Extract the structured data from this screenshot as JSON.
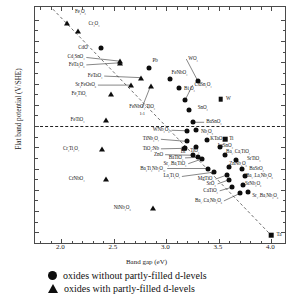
{
  "chart_data": {
    "type": "scatter",
    "title": "",
    "xlabel": "Band gap (eV)",
    "ylabel": "Flat band potential (V/SHE)",
    "xlim": [
      1.75,
      4.15
    ],
    "ylim": [
      -1.12,
      1.12
    ],
    "xticks": [
      2.0,
      2.5,
      3.0,
      3.5,
      4.0
    ],
    "yticks": [
      1.0,
      0.8,
      0.6,
      0.4,
      0.2,
      0,
      -0.2,
      -0.4,
      -0.6,
      -0.8,
      -1.0
    ],
    "grid": false,
    "zero_line": true,
    "trend_line": "dashed guide from upper-left to lower-right",
    "legend_position": "below-axes",
    "legend": [
      {
        "marker": "circle",
        "label": "oxides without partly-filled d-levels"
      },
      {
        "marker": "triangle",
        "label": "oxides with partly-filled d-levels"
      }
    ],
    "series": [
      {
        "name": "oxides with partly-filled d-levels",
        "marker": "triangle",
        "points": [
          {
            "label": "Fe₂O₃",
            "x": 2.05,
            "y": 0.97,
            "lx": 2.13,
            "ly": 1.07,
            "anchor": "left"
          },
          {
            "label": "Cr₂O₃",
            "x": 2.16,
            "y": 0.89,
            "lx": 2.26,
            "ly": 0.96,
            "anchor": "left"
          },
          {
            "label": "Cd₂SnO₄",
            "x": 2.56,
            "y": 0.61,
            "lx": 2.22,
            "ly": 0.645,
            "anchor": "right",
            "lead": true
          },
          {
            "label": "FeTa₂O₆",
            "x": 2.56,
            "y": 0.595,
            "lx": 2.22,
            "ly": 0.575,
            "anchor": "right",
            "lead": true
          },
          {
            "label": "FeTaO₄",
            "x": 2.76,
            "y": 0.455,
            "lx": 2.39,
            "ly": 0.47,
            "anchor": "right",
            "lead": true
          },
          {
            "label": "Sr₂FeOsO₆",
            "x": 2.66,
            "y": 0.385,
            "lx": 2.33,
            "ly": 0.385,
            "anchor": "right",
            "lead": true
          },
          {
            "label": "Fe₂TiO₅",
            "x": 2.47,
            "y": 0.3,
            "lx": 2.24,
            "ly": 0.3,
            "anchor": "right"
          },
          {
            "label": "FeNbO₄:TiO₃",
            "x": 2.85,
            "y": 0.375,
            "lx": 2.77,
            "ly": 0.175,
            "anchor": "center",
            "lead": true,
            "sub": "1:1"
          },
          {
            "label": "FeTiO₃",
            "x": 2.43,
            "y": 0.055,
            "lx": 2.22,
            "ly": 0.055,
            "anchor": "right"
          },
          {
            "label": "Cr₂Ti₂O₇",
            "x": 2.39,
            "y": -0.215,
            "lx": 2.17,
            "ly": -0.215,
            "anchor": "right"
          },
          {
            "label": "CrNbO₄",
            "x": 2.43,
            "y": -0.495,
            "lx": 2.22,
            "ly": -0.495,
            "anchor": "right"
          },
          {
            "label": "NiNb₂O₆",
            "x": 2.87,
            "y": -0.775,
            "lx": 2.66,
            "ly": -0.775,
            "anchor": "right"
          }
        ]
      },
      {
        "name": "oxides without partly-filled d-levels",
        "marker": "circle",
        "points": [
          {
            "label": "CdO",
            "x": 2.38,
            "y": 0.735,
            "lx": 2.25,
            "ly": 0.735,
            "anchor": "right"
          },
          {
            "label": "Pb",
            "x": 2.84,
            "y": 0.55,
            "lx": 2.87,
            "ly": 0.61,
            "anchor": "left"
          },
          {
            "label": "FeNbO₄",
            "x": 3.04,
            "y": 0.445,
            "lx": 3.05,
            "ly": 0.5,
            "anchor": "left"
          },
          {
            "label": "WO₃",
            "x": 3.3,
            "y": 0.425,
            "lx": 3.21,
            "ly": 0.63,
            "anchor": "left",
            "lead": true
          },
          {
            "label": "Bi₂O₃",
            "x": 3.12,
            "y": 0.36,
            "lx": 3.17,
            "ly": 0.345,
            "anchor": "left"
          },
          {
            "label": "CdSn₂O₄",
            "x": 3.18,
            "y": 0.245,
            "lx": 3.27,
            "ly": 0.385,
            "anchor": "left",
            "lead": true
          },
          {
            "label": "SnO₂",
            "x": 3.22,
            "y": 0.155,
            "lx": 3.3,
            "ly": 0.165,
            "anchor": "left"
          },
          {
            "label": "BaSnO₃",
            "x": 3.25,
            "y": 0.035,
            "lx": 3.38,
            "ly": 0.035,
            "anchor": "left",
            "lead": true
          },
          {
            "label": "W",
            "x": 3.52,
            "y": 0.255,
            "lx": 3.57,
            "ly": 0.255,
            "anchor": "left",
            "marker": "square"
          },
          {
            "label": "WNb₂O₆",
            "x": 3.2,
            "y": -0.045,
            "lx": 3.03,
            "ly": -0.04,
            "anchor": "right",
            "lead": true
          },
          {
            "label": "Nb₂O₅",
            "x": 3.28,
            "y": -0.035,
            "lx": 3.33,
            "ly": -0.055,
            "anchor": "left"
          },
          {
            "label": "TiNb₂O₇",
            "x": 3.2,
            "y": -0.145,
            "lx": 2.93,
            "ly": -0.125,
            "anchor": "right",
            "lead": true
          },
          {
            "label": "TiO₂:Nb",
            "x": 3.18,
            "y": -0.21,
            "lx": 2.93,
            "ly": -0.215,
            "anchor": "right",
            "lead": true
          },
          {
            "label": "Bi",
            "x": 3.17,
            "y": -0.215,
            "lx": 3.16,
            "ly": -0.245,
            "anchor": "center",
            "marker": "square"
          },
          {
            "label": "TiO₂",
            "x": 3.28,
            "y": -0.195,
            "lx": 3.27,
            "ly": -0.235,
            "anchor": "center"
          },
          {
            "label": "KTaO₃",
            "x": 3.39,
            "y": -0.135,
            "lx": 3.42,
            "ly": -0.125,
            "anchor": "left"
          },
          {
            "label": "Ti",
            "x": 3.56,
            "y": -0.125,
            "lx": 3.6,
            "ly": -0.125,
            "anchor": "left",
            "marker": "square"
          },
          {
            "label": "LaSnO₃",
            "x": 3.51,
            "y": -0.2,
            "lx": 3.49,
            "ly": -0.185,
            "anchor": "left"
          },
          {
            "label": "ZnO",
            "x": 3.25,
            "y": -0.275,
            "lx": 2.97,
            "ly": -0.27,
            "anchor": "right",
            "lead": true
          },
          {
            "label": "BaTiO₃",
            "x": 3.3,
            "y": -0.295,
            "lx": 3.16,
            "ly": -0.3,
            "anchor": "right",
            "lead": true
          },
          {
            "label": "Sr₁₋BaₓTiO₃",
            "x": 3.34,
            "y": -0.31,
            "lx": 3.19,
            "ly": -0.355,
            "anchor": "right",
            "lead": true
          },
          {
            "label": "Ba₁₋CaₓTiO₃",
            "x": 3.56,
            "y": -0.275,
            "lx": 3.57,
            "ly": -0.245,
            "anchor": "left"
          },
          {
            "label": "SrTiO₃",
            "x": 3.66,
            "y": -0.32,
            "lx": 3.77,
            "ly": -0.315,
            "anchor": "left"
          },
          {
            "label": "ZnNb₂O₆",
            "x": 3.6,
            "y": -0.385,
            "lx": 3.6,
            "ly": -0.355,
            "anchor": "left"
          },
          {
            "label": "Ba₂Ti₂Nb₂O₁₂",
            "x": 3.4,
            "y": -0.4,
            "lx": 2.99,
            "ly": -0.4,
            "anchor": "right",
            "lead": true
          },
          {
            "label": "La₂Ti₂O₇",
            "x": 3.45,
            "y": -0.435,
            "lx": 3.13,
            "ly": -0.475,
            "anchor": "right",
            "lead": true
          },
          {
            "label": "MgTiO₃",
            "x": 3.58,
            "y": -0.46,
            "lx": 3.45,
            "ly": -0.5,
            "anchor": "right",
            "lead": true
          },
          {
            "label": "SrO₂",
            "x": 3.6,
            "y": -0.505,
            "lx": 3.47,
            "ly": -0.545,
            "anchor": "right",
            "lead": true
          },
          {
            "label": "BaSrO₃",
            "x": 3.72,
            "y": -0.405,
            "lx": 3.79,
            "ly": -0.4,
            "anchor": "left"
          },
          {
            "label": "Ba₁₋LaₓNb₂O₆",
            "x": 3.75,
            "y": -0.475,
            "lx": 3.76,
            "ly": -0.475,
            "anchor": "left"
          },
          {
            "label": "SrNb₂O₆",
            "x": 3.73,
            "y": -0.555,
            "lx": 3.75,
            "ly": -0.545,
            "anchor": "left"
          },
          {
            "label": "CaTiO₃",
            "x": 3.63,
            "y": -0.575,
            "lx": 3.49,
            "ly": -0.61,
            "anchor": "right",
            "lead": true
          },
          {
            "label": "Ba₁₋CaₓNb₂O₆",
            "x": 3.7,
            "y": -0.635,
            "lx": 3.53,
            "ly": -0.705,
            "anchor": "right",
            "lead": true
          },
          {
            "label": "Sr₁₋BaₓNb₂O₆",
            "x": 3.78,
            "y": -0.62,
            "lx": 3.82,
            "ly": -0.66,
            "anchor": "left"
          },
          {
            "label": "Ta",
            "x": 4.0,
            "y": -1.03,
            "lx": 4.05,
            "ly": -1.025,
            "anchor": "left",
            "marker": "square"
          }
        ]
      }
    ]
  }
}
